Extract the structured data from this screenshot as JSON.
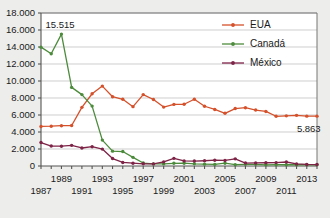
{
  "chart_data": {
    "type": "line",
    "title": "",
    "subtitle": "",
    "xlabel": "",
    "ylabel": "",
    "xlim": [
      1987,
      2014
    ],
    "ylim": [
      0,
      18000
    ],
    "grid": true,
    "legend_position": "top-right",
    "ytick_labels": [
      "18.000",
      "16.000",
      "14.000",
      "12.000",
      "10.000",
      "8.000",
      "6.000",
      "4.000",
      "2.000",
      "0"
    ],
    "ytick_values": [
      18000,
      16000,
      14000,
      12000,
      10000,
      8000,
      6000,
      4000,
      2000,
      0
    ],
    "xtick_labels_upper": [
      "1989",
      "1993",
      "1997",
      "2001",
      "2005",
      "2009",
      "2013"
    ],
    "xtick_values_upper": [
      1989,
      1993,
      1997,
      2001,
      2005,
      2009,
      2013
    ],
    "xtick_labels_lower": [
      "1987",
      "1991",
      "1995",
      "1999",
      "2003",
      "2007",
      "2011"
    ],
    "xtick_values_lower": [
      1987,
      1991,
      1995,
      1999,
      2003,
      2007,
      2011
    ],
    "x": [
      1987,
      1988,
      1989,
      1990,
      1991,
      1992,
      1993,
      1994,
      1995,
      1996,
      1997,
      1998,
      1999,
      2000,
      2001,
      2002,
      2003,
      2004,
      2005,
      2006,
      2007,
      2008,
      2009,
      2010,
      2011,
      2012,
      2013,
      2014
    ],
    "series": [
      {
        "name": "EUA",
        "color": "#d4512b",
        "values": [
          4650,
          4680,
          4740,
          4760,
          6900,
          8500,
          9400,
          8150,
          7850,
          6980,
          8400,
          7820,
          6930,
          7250,
          7260,
          7850,
          7030,
          6650,
          6200,
          6760,
          6860,
          6580,
          6420,
          5850,
          5900,
          5960,
          5863,
          5863
        ]
      },
      {
        "name": "Canadá",
        "color": "#4c8b3c",
        "values": [
          13980,
          13200,
          15515,
          9250,
          8400,
          7050,
          3050,
          1750,
          1700,
          1020,
          350,
          250,
          250,
          320,
          330,
          260,
          220,
          190,
          330,
          160,
          200,
          200,
          140,
          150,
          150,
          150,
          150,
          150
        ]
      },
      {
        "name": "México",
        "color": "#7d2346",
        "values": [
          2760,
          2350,
          2330,
          2430,
          2120,
          2270,
          1990,
          880,
          420,
          330,
          260,
          250,
          480,
          900,
          600,
          580,
          620,
          680,
          650,
          840,
          350,
          360,
          380,
          400,
          470,
          250,
          180,
          170
        ]
      }
    ],
    "annotations": [
      {
        "label": "15.515",
        "x": 1989,
        "y": 15515,
        "series": "Canadá"
      },
      {
        "label": "5.863",
        "x": 2013,
        "y": 5863,
        "series": "EUA"
      }
    ]
  },
  "legend": {
    "items": [
      {
        "label": "EUA",
        "color": "#d4512b"
      },
      {
        "label": "Canadá",
        "color": "#4c8b3c"
      },
      {
        "label": "México",
        "color": "#7d2346"
      }
    ]
  }
}
